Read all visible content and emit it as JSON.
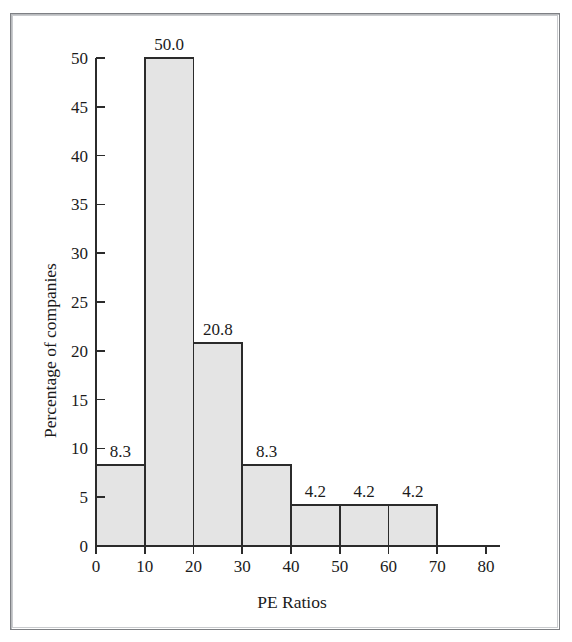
{
  "chart_data": {
    "type": "bar",
    "title": "",
    "xlabel": "PE Ratios",
    "ylabel": "Percentage of companies",
    "xlim": [
      0,
      80
    ],
    "ylim": [
      0,
      50
    ],
    "grid": false,
    "legend": null,
    "bin_width": 10,
    "bin_edges": [
      0,
      10,
      20,
      30,
      40,
      50,
      60,
      70
    ],
    "categories": [
      "0-10",
      "10-20",
      "20-30",
      "30-40",
      "40-50",
      "50-60",
      "60-70"
    ],
    "values": [
      8.3,
      50.0,
      20.8,
      8.3,
      4.2,
      4.2,
      4.2
    ],
    "data_labels": [
      "8.3",
      "50.0",
      "20.8",
      "8.3",
      "4.2",
      "4.2",
      "4.2"
    ],
    "xticks": [
      0,
      10,
      20,
      30,
      40,
      50,
      60,
      70,
      80
    ],
    "xtick_labels": [
      "0",
      "10",
      "20",
      "30",
      "40",
      "50",
      "60",
      "70",
      "80"
    ],
    "yticks": [
      0,
      5,
      10,
      15,
      20,
      25,
      30,
      35,
      40,
      45,
      50
    ],
    "ytick_labels": [
      "0",
      "5",
      "10",
      "15",
      "20",
      "25",
      "30",
      "35",
      "40",
      "45",
      "50"
    ],
    "bar_fill_color": "#e4e4e4",
    "bar_edge_color": "#2b2b2b",
    "axis_color": "#2b2b2b",
    "background_color": "#ffffff",
    "frame_color": "#7e8084"
  }
}
